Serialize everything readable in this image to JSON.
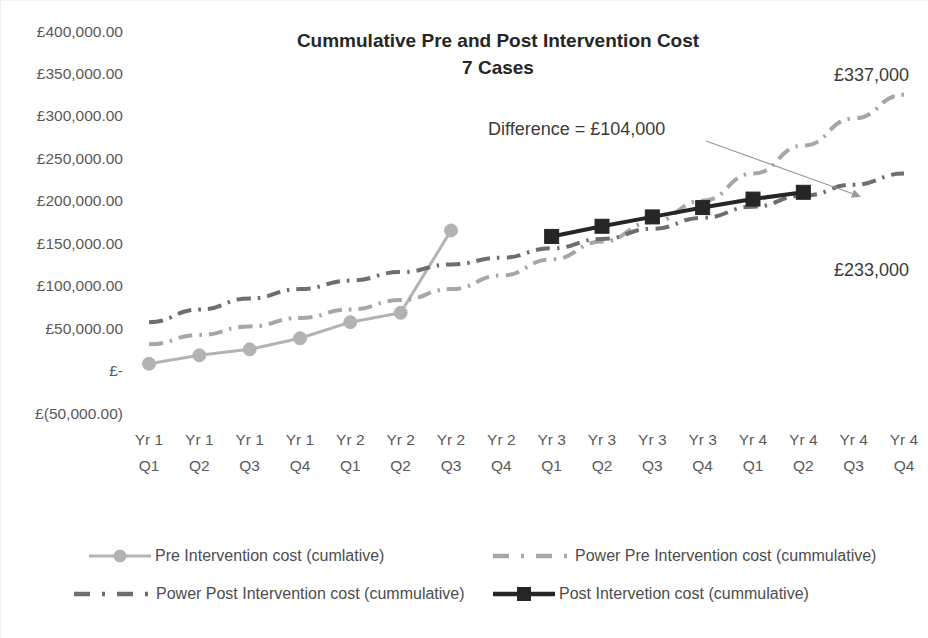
{
  "chart_data": {
    "type": "line",
    "title": "Cummulative Pre and Post Intervention Cost",
    "subtitle": "7 Cases",
    "xlabel": "",
    "ylabel": "",
    "ylim": [
      -50000,
      400000
    ],
    "ytick_labels": [
      "£400,000.00",
      "£350,000.00",
      "£300,000.00",
      "£250,000.00",
      "£200,000.00",
      "£150,000.00",
      "£100,000.00",
      "£50,000.00",
      "£-",
      "£(50,000.00)"
    ],
    "ytick_values": [
      400000,
      350000,
      300000,
      250000,
      200000,
      150000,
      100000,
      50000,
      0,
      -50000
    ],
    "categories": [
      "Yr 1 Q1",
      "Yr 1 Q2",
      "Yr 1 Q3",
      "Yr 1 Q4",
      "Yr 2 Q1",
      "Yr 2 Q2",
      "Yr 2 Q3",
      "Yr 2 Q4",
      "Yr 3 Q1",
      "Yr 3 Q2",
      "Yr 3 Q3",
      "Yr 3 Q4",
      "Yr 4 Q1",
      "Yr 4 Q2",
      "Yr 4 Q3",
      "Yr 4 Q4"
    ],
    "categories_split": [
      {
        "top": "Yr 1",
        "bottom": "Q1"
      },
      {
        "top": "Yr 1",
        "bottom": "Q2"
      },
      {
        "top": "Yr 1",
        "bottom": "Q3"
      },
      {
        "top": "Yr 1",
        "bottom": "Q4"
      },
      {
        "top": "Yr 2",
        "bottom": "Q1"
      },
      {
        "top": "Yr 2",
        "bottom": "Q2"
      },
      {
        "top": "Yr 2",
        "bottom": "Q3"
      },
      {
        "top": "Yr 2",
        "bottom": "Q4"
      },
      {
        "top": "Yr 3",
        "bottom": "Q1"
      },
      {
        "top": "Yr 3",
        "bottom": "Q2"
      },
      {
        "top": "Yr 3",
        "bottom": "Q3"
      },
      {
        "top": "Yr 3",
        "bottom": "Q4"
      },
      {
        "top": "Yr 4",
        "bottom": "Q1"
      },
      {
        "top": "Yr 4",
        "bottom": "Q2"
      },
      {
        "top": "Yr 4",
        "bottom": "Q3"
      },
      {
        "top": "Yr 4",
        "bottom": "Q4"
      }
    ],
    "grid": false,
    "legend_position": "bottom",
    "series": [
      {
        "name": "Pre Intervention cost (cumlative)",
        "key": "pre",
        "style": "solid-marker",
        "marker": "circle",
        "color": "#b3b3b3",
        "width": 3,
        "values": [
          8000,
          18000,
          25000,
          38000,
          57000,
          68000,
          165000,
          null,
          null,
          null,
          null,
          null,
          null,
          null,
          null,
          null
        ]
      },
      {
        "name": "Power Pre Intervention cost (cummulative)",
        "key": "power_pre",
        "style": "dash-dot",
        "marker": "none",
        "color": "#a6a6a6",
        "width": 4,
        "values": [
          31000,
          42000,
          52000,
          62000,
          72000,
          83000,
          96000,
          112000,
          131000,
          152000,
          175000,
          200000,
          232000,
          265000,
          297000,
          325000
        ]
      },
      {
        "name": "Power Post Intervention cost (cummulative)",
        "key": "power_post",
        "style": "dash-dot",
        "marker": "none",
        "color": "#6e6e6e",
        "width": 4,
        "values": [
          57000,
          72000,
          85000,
          96000,
          106000,
          116000,
          125000,
          133000,
          144000,
          155000,
          167000,
          180000,
          193000,
          206000,
          219000,
          232000
        ]
      },
      {
        "name": "Post Intervetion cost (cummulative)",
        "key": "post",
        "style": "solid-marker",
        "marker": "square",
        "color": "#262626",
        "width": 4,
        "values": [
          null,
          null,
          null,
          null,
          null,
          null,
          null,
          null,
          158000,
          170000,
          181000,
          192000,
          202000,
          210000,
          null,
          null
        ]
      }
    ],
    "annotations": [
      {
        "name": "difference-annotation",
        "text": "Difference = £104,000",
        "x": 487,
        "y": 134,
        "anchor": "start",
        "arrow": {
          "x1": 705,
          "y1": 140,
          "x2": 858,
          "y2": 195
        }
      },
      {
        "name": "power-pre-endpoint-label",
        "text": "£337,000",
        "x": 833,
        "y": 80,
        "anchor": "start",
        "arrow": null
      },
      {
        "name": "power-post-endpoint-label",
        "text": "£233,000",
        "x": 833,
        "y": 275,
        "anchor": "start",
        "arrow": null
      }
    ],
    "legend": [
      {
        "label": "Pre Intervention cost (cumlative)",
        "swatch": "solid-circle",
        "color": "#b3b3b3"
      },
      {
        "label": "Power Pre Intervention cost (cummulative)",
        "swatch": "dash-dot",
        "color": "#a6a6a6"
      },
      {
        "label": "Power Post Intervention cost (cummulative)",
        "swatch": "dash-dot",
        "color": "#6e6e6e"
      },
      {
        "label": "Post Intervetion cost (cummulative)",
        "swatch": "solid-square",
        "color": "#262626"
      }
    ],
    "colors": {
      "pre": "#b3b3b3",
      "power_pre": "#a6a6a6",
      "power_post": "#6e6e6e",
      "post": "#262626",
      "axis_text": "#595959",
      "title_text": "#262626",
      "background": "#ffffff"
    }
  }
}
